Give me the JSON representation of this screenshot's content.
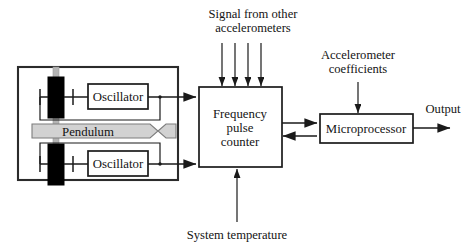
{
  "figure": {
    "background_color": "#ffffff",
    "line_color": "#1a1a1a",
    "crystal_color": "#000000",
    "pendulum_fill": "#d2d2d2",
    "support_bar_color": "#b4b4b4"
  },
  "sensor_assembly": {
    "name": "accelerometer sensor housing",
    "pendulum_label": "Pendulum",
    "oscillator_top_label": "Oscillator",
    "oscillator_bottom_label": "Oscillator",
    "resonator_count": 2
  },
  "blocks": {
    "frequency_counter": {
      "line1": "Frequency",
      "line2": "pulse",
      "line3": "counter"
    },
    "microprocessor": {
      "label": "Microprocessor"
    }
  },
  "annotations": {
    "signal_other": {
      "line1": "Signal from other",
      "line2": "accelerometers",
      "arrow_count": 4
    },
    "coefficients": {
      "line1": "Accelerometer",
      "line2": "coefficients"
    },
    "system_temperature": {
      "label": "System temperature"
    },
    "output": {
      "label": "Output"
    }
  }
}
